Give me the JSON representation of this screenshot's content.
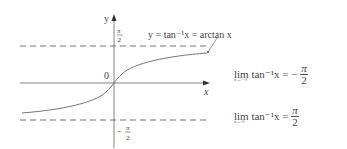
{
  "graph": {
    "y_axis_label": "y",
    "x_axis_label": "x",
    "origin_label": "0",
    "upper_asymptote_label": {
      "num": "π",
      "den": "2"
    },
    "lower_asymptote_label": {
      "sign": "−",
      "num": "π",
      "den": "2"
    },
    "curve_label": "y = tan⁻¹x = arctan x",
    "colors": {
      "axes": "#555555",
      "curve": "#777777",
      "dashed": "#666666",
      "text": "#444444"
    }
  },
  "limits": [
    {
      "sub": "x→−∞",
      "expr": "lim tan⁻¹x = −",
      "num": "π",
      "den": "2"
    },
    {
      "sub": "x→∞",
      "expr": "lim tan⁻¹x =",
      "num": "π",
      "den": "2"
    }
  ]
}
